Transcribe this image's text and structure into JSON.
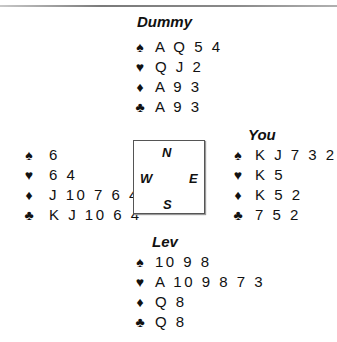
{
  "layout": {
    "title": "Bridge deal diagram"
  },
  "suits": [
    {
      "name": "spades",
      "symbol": "♠"
    },
    {
      "name": "hearts",
      "symbol": "♥"
    },
    {
      "name": "diamonds",
      "symbol": "♦"
    },
    {
      "name": "clubs",
      "symbol": "♣"
    }
  ],
  "compass": {
    "north": "N",
    "south": "S",
    "east": "E",
    "west": "W"
  },
  "hands": {
    "north": {
      "label": "Dummy",
      "spades": "A Q 5 4",
      "hearts": "Q J 2",
      "diamonds": "A 9 3",
      "clubs": "A 9 3"
    },
    "west": {
      "label": "",
      "spades": "6",
      "hearts": "6 4",
      "diamonds": "J 10 7 6 4",
      "clubs": "K J 10 6 4"
    },
    "east": {
      "label": "You",
      "spades": "K J 7 3 2",
      "hearts": "K 5",
      "diamonds": "K 5 2",
      "clubs": "7 5 2"
    },
    "south": {
      "label": "Lev",
      "spades": "10 9 8",
      "hearts": "A 10 9 8 7 3",
      "diamonds": "Q 8",
      "clubs": "Q 8"
    }
  }
}
